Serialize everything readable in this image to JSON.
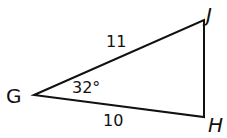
{
  "figure": {
    "type": "triangle",
    "vertices": {
      "G": {
        "label": "G",
        "x": 34,
        "y": 95
      },
      "J": {
        "label": "J",
        "x": 204,
        "y": 20
      },
      "H": {
        "label": "H",
        "x": 204,
        "y": 117
      }
    },
    "sides": {
      "GJ": {
        "label": "11"
      },
      "GH": {
        "label": "10"
      }
    },
    "angles": {
      "G": {
        "label": "32°"
      }
    },
    "stroke_color": "#111111"
  }
}
